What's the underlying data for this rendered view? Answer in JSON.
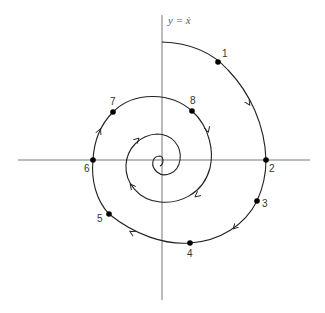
{
  "diagram": {
    "type": "phase-portrait-spiral",
    "axis_label_y": "y = ẋ",
    "colors": {
      "axis": "#777777",
      "curve": "#222222",
      "point": "#000000",
      "background": "#ffffff"
    },
    "points": [
      {
        "id": "1",
        "label": "1"
      },
      {
        "id": "2",
        "label": "2"
      },
      {
        "id": "3",
        "label": "3"
      },
      {
        "id": "4",
        "label": "4"
      },
      {
        "id": "5",
        "label": "5"
      },
      {
        "id": "6",
        "label": "6"
      },
      {
        "id": "7",
        "label": "7"
      },
      {
        "id": "8",
        "label": "8"
      }
    ],
    "direction": "clockwise-inward"
  }
}
